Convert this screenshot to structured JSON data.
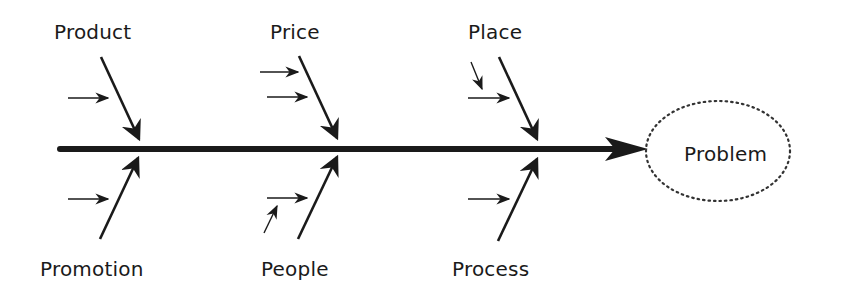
{
  "diagram": {
    "type": "fishbone",
    "effect": "Problem",
    "colors": {
      "line": "#1a1a1a",
      "background": "#ffffff",
      "ellipse_border": "#333333"
    },
    "categories_top": [
      {
        "label": "Product",
        "sub_causes": 1
      },
      {
        "label": "Price",
        "sub_causes": 2
      },
      {
        "label": "Place",
        "sub_causes": 1,
        "sub_sub_causes": 1
      }
    ],
    "categories_bottom": [
      {
        "label": "Promotion",
        "sub_causes": 1
      },
      {
        "label": "People",
        "sub_causes": 1,
        "sub_sub_causes": 1
      },
      {
        "label": "Process",
        "sub_causes": 1
      }
    ]
  }
}
